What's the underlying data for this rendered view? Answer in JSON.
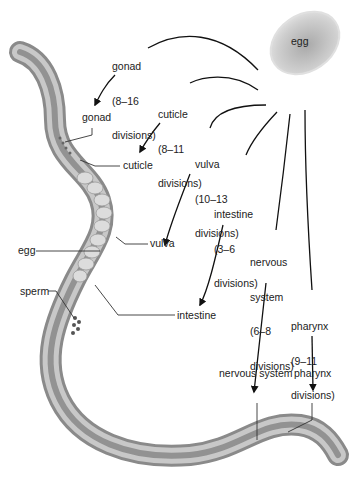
{
  "source": {
    "label": "egg"
  },
  "divisions": [
    {
      "id": "gonad",
      "line1": "gonad",
      "line2": "(8–16",
      "line3": "divisions)"
    },
    {
      "id": "cuticle",
      "line1": "cuticle",
      "line2": "(8–11",
      "line3": "divisions)"
    },
    {
      "id": "vulva",
      "line1": "vulva",
      "line2": "(10–13",
      "line3": "divisions)"
    },
    {
      "id": "intestine",
      "line1": "intestine",
      "line2": "(3–6",
      "line3": "divisions)"
    },
    {
      "id": "nervous-system",
      "line1": "nervous",
      "line2": "system",
      "line3": "(6–8",
      "line4": "divisions)"
    },
    {
      "id": "pharynx",
      "line1": "pharynx",
      "line2": "(9–11",
      "line3": "divisions)"
    }
  ],
  "anatomy_labels": {
    "gonad": "gonad",
    "cuticle": "cuticle",
    "egg": "egg",
    "vulva": "vulva",
    "sperm": "sperm",
    "intestine": "intestine",
    "nervous_system": "nervous system",
    "pharynx": "pharynx"
  }
}
